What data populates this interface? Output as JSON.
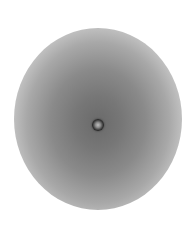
{
  "image": {
    "description": "Grayscale circular radial gradient with a small dark bead at the center",
    "background_color": "#ffffff",
    "disc_center_color": "#6a6a6a",
    "disc_edge_color": "#f2f2f2",
    "bead_color": "#2a2a2a"
  }
}
